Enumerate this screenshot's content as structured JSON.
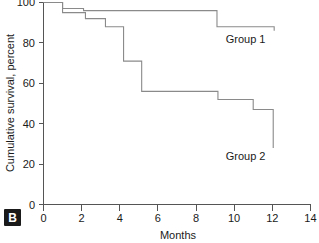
{
  "panel": {
    "letter": "B"
  },
  "chart_data": {
    "type": "line",
    "subtype": "kaplan-meier-step",
    "title": "",
    "xlabel": "Months",
    "ylabel": "Cumulative survival, percent",
    "xlim": [
      0,
      14
    ],
    "ylim": [
      0,
      100
    ],
    "xticks": [
      0,
      2,
      4,
      6,
      8,
      10,
      12,
      14
    ],
    "xtick_labels": [
      "0",
      "2",
      "4",
      "6",
      "8",
      "10",
      "12",
      "14"
    ],
    "yticks": [
      0,
      20,
      40,
      60,
      80,
      100
    ],
    "ytick_labels": [
      "0",
      "20",
      "40",
      "60",
      "80",
      "100"
    ],
    "grid": false,
    "legend": "inline-annotations",
    "line_color": "#8a8a8a",
    "series": [
      {
        "name": "Group 1",
        "label": "Group 1",
        "color": "#8a8a8a",
        "label_x": 10.6,
        "label_y": 80,
        "steps": [
          {
            "x": 0.0,
            "y": 100
          },
          {
            "x": 1.0,
            "y": 100
          },
          {
            "x": 1.0,
            "y": 97
          },
          {
            "x": 2.1,
            "y": 97
          },
          {
            "x": 2.1,
            "y": 96
          },
          {
            "x": 9.1,
            "y": 96
          },
          {
            "x": 9.1,
            "y": 88
          },
          {
            "x": 12.1,
            "y": 88
          },
          {
            "x": 12.1,
            "y": 86
          }
        ]
      },
      {
        "name": "Group 2",
        "label": "Group 2",
        "color": "#8a8a8a",
        "label_x": 10.6,
        "label_y": 22,
        "steps": [
          {
            "x": 0.0,
            "y": 100
          },
          {
            "x": 1.0,
            "y": 100
          },
          {
            "x": 1.0,
            "y": 95
          },
          {
            "x": 2.2,
            "y": 95
          },
          {
            "x": 2.2,
            "y": 92
          },
          {
            "x": 3.25,
            "y": 92
          },
          {
            "x": 3.25,
            "y": 88
          },
          {
            "x": 4.2,
            "y": 88
          },
          {
            "x": 4.2,
            "y": 71
          },
          {
            "x": 5.15,
            "y": 71
          },
          {
            "x": 5.15,
            "y": 56
          },
          {
            "x": 9.15,
            "y": 56
          },
          {
            "x": 9.15,
            "y": 52
          },
          {
            "x": 11.0,
            "y": 52
          },
          {
            "x": 11.0,
            "y": 47
          },
          {
            "x": 12.05,
            "y": 47
          },
          {
            "x": 12.05,
            "y": 28
          }
        ]
      }
    ]
  }
}
